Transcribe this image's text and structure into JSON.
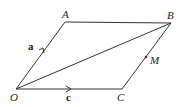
{
  "diagram": {
    "type": "parallelogram-vectors",
    "points": {
      "O": {
        "label": "O",
        "x": 16,
        "y": 89
      },
      "A": {
        "label": "A",
        "x": 65,
        "y": 22
      },
      "B": {
        "label": "B",
        "x": 171,
        "y": 23
      },
      "C": {
        "label": "C",
        "x": 122,
        "y": 89
      },
      "M": {
        "label": "M",
        "x": 146,
        "y": 57
      }
    },
    "vectors": {
      "a": {
        "label": "a",
        "from": "O",
        "to": "A"
      },
      "c": {
        "label": "c",
        "from": "O",
        "to": "C"
      }
    },
    "segments": [
      "OA",
      "AB",
      "BC",
      "CO",
      "OB"
    ],
    "color": "#333333"
  }
}
